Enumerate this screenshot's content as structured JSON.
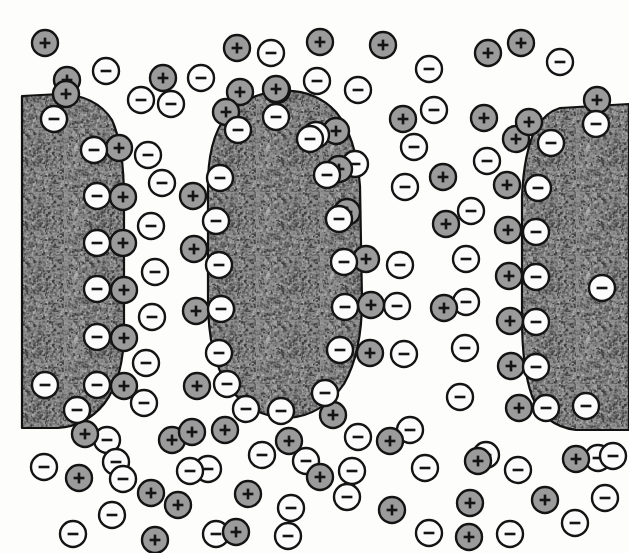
{
  "figure": {
    "width": 629,
    "height": 553,
    "background_color": "#fdfdfb"
  },
  "legend": {
    "positive_symbol": "+",
    "negative_symbol": "−",
    "positive_label": "positive-ion",
    "negative_label": "negative-ion",
    "particle_label": "colloidal-particle"
  },
  "style": {
    "ion_radius": 13,
    "ion_inner_radius": 10.5,
    "positive_fill": "#9b9b9b",
    "negative_fill": "#fbfbfb",
    "ion_ring_color": "#141414",
    "ion_ring_width": 2.4,
    "glyph_color": "#141414",
    "particle_fill": "#8e8e8e",
    "particle_stroke": "#111111",
    "particle_stroke_width": 2.2,
    "speckle_dark": "#3a3a3a",
    "speckle_mid": "#6e6e6e",
    "speckle_light": "#b4b4b4"
  },
  "particles": [
    {
      "name": "particle-left",
      "path": "M 22 96 L 60 94 Q 96 95 112 120 Q 124 146 124 200 L 124 330 Q 124 378 104 404 Q 86 426 58 428 L 22 428 Z",
      "clipped_left_edge": true
    },
    {
      "name": "particle-middle",
      "path": "M 272 92 Q 312 86 336 112 Q 356 136 360 186 L 362 300 Q 362 352 344 384 Q 322 416 288 418 Q 252 418 228 386 Q 208 356 208 300 L 208 178 Q 210 130 232 110 Q 250 95 272 92 Z",
      "clipped_left_edge": false
    },
    {
      "name": "particle-right",
      "path": "M 560 108 L 629 104 L 629 430 L 576 430 Q 544 426 532 396 Q 522 368 522 318 L 522 196 Q 524 152 536 128 Q 546 112 560 108 Z",
      "clipped_left_edge": false
    }
  ],
  "chart_data": {
    "type": "scatter",
    "xlabel": "",
    "ylabel": "",
    "xlim": [
      0,
      629
    ],
    "ylim": [
      0,
      553
    ],
    "grid": false,
    "legend_position": "none",
    "series": [
      {
        "name": "surface-negative-ions",
        "charge": "negative",
        "symbol": "−",
        "description": "Negative ions adsorbed directly on the colloidal particle surfaces",
        "points": [
          [
            54,
            119
          ],
          [
            94,
            150
          ],
          [
            97,
            196
          ],
          [
            97,
            243
          ],
          [
            97,
            289
          ],
          [
            97,
            337
          ],
          [
            97,
            385
          ],
          [
            45,
            385
          ],
          [
            77,
            410
          ],
          [
            238,
            130
          ],
          [
            276,
            117
          ],
          [
            316,
            135
          ],
          [
            220,
            178
          ],
          [
            216,
            221
          ],
          [
            219,
            265
          ],
          [
            221,
            309
          ],
          [
            219,
            353
          ],
          [
            227,
            384
          ],
          [
            246,
            409
          ],
          [
            281,
            411
          ],
          [
            325,
            393
          ],
          [
            340,
            350
          ],
          [
            345,
            307
          ],
          [
            344,
            262
          ],
          [
            339,
            219
          ],
          [
            327,
            175
          ],
          [
            310,
            139
          ],
          [
            551,
            143
          ],
          [
            538,
            188
          ],
          [
            536,
            232
          ],
          [
            536,
            277
          ],
          [
            536,
            322
          ],
          [
            536,
            367
          ],
          [
            546,
            408
          ],
          [
            586,
            406
          ],
          [
            596,
            124
          ],
          [
            602,
            288
          ],
          [
            613,
            456
          ]
        ]
      },
      {
        "name": "counter-positive-ions",
        "charge": "positive",
        "symbol": "+",
        "description": "Positive counter-ions forming the Stern/diffuse layer just outside the particle surfaces",
        "points": [
          [
            66,
            94
          ],
          [
            119,
            148
          ],
          [
            123,
            197
          ],
          [
            123,
            243
          ],
          [
            124,
            290
          ],
          [
            124,
            338
          ],
          [
            124,
            386
          ],
          [
            85,
            434
          ],
          [
            276,
            89
          ],
          [
            226,
            112
          ],
          [
            336,
            131
          ],
          [
            339,
            169
          ],
          [
            347,
            212
          ],
          [
            366,
            259
          ],
          [
            371,
            305
          ],
          [
            370,
            353
          ],
          [
            333,
            415
          ],
          [
            225,
            430
          ],
          [
            289,
            441
          ],
          [
            192,
            432
          ],
          [
            516,
            139
          ],
          [
            507,
            185
          ],
          [
            508,
            230
          ],
          [
            509,
            276
          ],
          [
            510,
            321
          ],
          [
            511,
            366
          ],
          [
            519,
            408
          ],
          [
            529,
            122
          ],
          [
            478,
            461
          ],
          [
            576,
            459
          ]
        ]
      },
      {
        "name": "bulk-positive-ions",
        "charge": "positive",
        "symbol": "+",
        "description": "Free positive ions dispersed in the bulk electrolyte",
        "points": [
          [
            45,
            43
          ],
          [
            67,
            80
          ],
          [
            163,
            78
          ],
          [
            237,
            48
          ],
          [
            240,
            92
          ],
          [
            277,
            90
          ],
          [
            320,
            42
          ],
          [
            383,
            45
          ],
          [
            488,
            53
          ],
          [
            403,
            119
          ],
          [
            484,
            118
          ],
          [
            521,
            43
          ],
          [
            597,
            100
          ],
          [
            193,
            196
          ],
          [
            194,
            249
          ],
          [
            196,
            311
          ],
          [
            197,
            386
          ],
          [
            446,
            224
          ],
          [
            444,
            308
          ],
          [
            443,
            177
          ],
          [
            172,
            440
          ],
          [
            320,
            477
          ],
          [
            390,
            441
          ],
          [
            79,
            478
          ],
          [
            178,
            505
          ],
          [
            155,
            540
          ],
          [
            248,
            494
          ],
          [
            392,
            510
          ],
          [
            470,
            503
          ],
          [
            545,
            500
          ],
          [
            236,
            532
          ],
          [
            469,
            537
          ],
          [
            151,
            493
          ]
        ]
      },
      {
        "name": "bulk-negative-ions",
        "charge": "negative",
        "symbol": "−",
        "description": "Free negative ions dispersed in the bulk electrolyte",
        "points": [
          [
            106,
            71
          ],
          [
            271,
            53
          ],
          [
            201,
            78
          ],
          [
            317,
            81
          ],
          [
            355,
            164
          ],
          [
            429,
            69
          ],
          [
            560,
            62
          ],
          [
            141,
            100
          ],
          [
            171,
            104
          ],
          [
            358,
            90
          ],
          [
            434,
            110
          ],
          [
            487,
            161
          ],
          [
            148,
            155
          ],
          [
            162,
            183
          ],
          [
            414,
            147
          ],
          [
            405,
            187
          ],
          [
            151,
            226
          ],
          [
            400,
            265
          ],
          [
            466,
            259
          ],
          [
            155,
            272
          ],
          [
            471,
            211
          ],
          [
            152,
            317
          ],
          [
            397,
            306
          ],
          [
            466,
            302
          ],
          [
            146,
            363
          ],
          [
            404,
            354
          ],
          [
            465,
            348
          ],
          [
            144,
            403
          ],
          [
            460,
            397
          ],
          [
            262,
            455
          ],
          [
            107,
            440
          ],
          [
            358,
            437
          ],
          [
            410,
            430
          ],
          [
            306,
            461
          ],
          [
            352,
            471
          ],
          [
            425,
            468
          ],
          [
            116,
            462
          ],
          [
            208,
            469
          ],
          [
            486,
            455
          ],
          [
            44,
            467
          ],
          [
            112,
            515
          ],
          [
            190,
            471
          ],
          [
            291,
            508
          ],
          [
            216,
            534
          ],
          [
            347,
            497
          ],
          [
            429,
            533
          ],
          [
            288,
            536
          ],
          [
            518,
            470
          ],
          [
            510,
            534
          ],
          [
            575,
            523
          ],
          [
            605,
            498
          ],
          [
            598,
            458
          ],
          [
            73,
            534
          ],
          [
            123,
            479
          ]
        ]
      }
    ]
  }
}
